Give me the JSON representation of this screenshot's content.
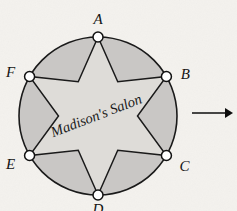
{
  "figure": {
    "kind": "geometry-diagram",
    "background_color": "#f4f2ee",
    "circle": {
      "label": "outer-circle",
      "center_x": 98,
      "center_y": 116,
      "radius": 79,
      "fill_color": "#c9c7c5",
      "stroke_color": "#1a1a1a"
    },
    "star": {
      "label": "six-pointed-star",
      "points": 6,
      "fill_color": "#dedcd8",
      "stroke_color": "#1a1a1a",
      "inner_radius_ratio": 0.5
    },
    "center_text": {
      "text": "Madison's Salon",
      "rotation_degrees": -21
    },
    "vertices": [
      {
        "id": "A",
        "label": "A",
        "angle_degrees": -90,
        "label_dx": 0,
        "label_dy": -13
      },
      {
        "id": "B",
        "label": "B",
        "angle_degrees": -30,
        "label_dx": 19,
        "label_dy": 2
      },
      {
        "id": "C",
        "label": "C",
        "angle_degrees": 30,
        "label_dx": 18,
        "label_dy": 15
      },
      {
        "id": "D",
        "label": "D",
        "angle_degrees": 90,
        "label_dx": 0,
        "label_dy": 19
      },
      {
        "id": "E",
        "label": "E",
        "angle_degrees": 150,
        "label_dx": -19,
        "label_dy": 13
      },
      {
        "id": "F",
        "label": "F",
        "angle_degrees": -150,
        "label_dx": -19,
        "label_dy": 0
      }
    ],
    "vertex_marker": {
      "radius": 5,
      "fill_color": "#ffffff",
      "stroke_color": "#111111"
    },
    "arrow": {
      "label": "right-arrow",
      "x_start": 192,
      "x_end": 233,
      "y": 113,
      "color": "#0d0d0d"
    }
  }
}
